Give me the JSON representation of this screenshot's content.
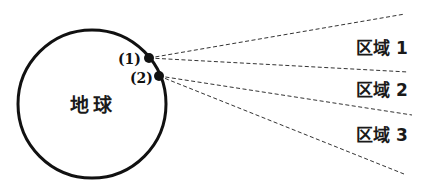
{
  "diagram": {
    "earth_label": "地球",
    "points": [
      {
        "label": "(1)",
        "x": 149,
        "y": 58
      },
      {
        "label": "(2)",
        "x": 159,
        "y": 76
      }
    ],
    "regions": [
      {
        "label": "区域 1"
      },
      {
        "label": "区域 2"
      },
      {
        "label": "区域 3"
      }
    ],
    "colors": {
      "stroke": "#111111",
      "dashed": "#333333",
      "background": "#ffffff"
    }
  }
}
